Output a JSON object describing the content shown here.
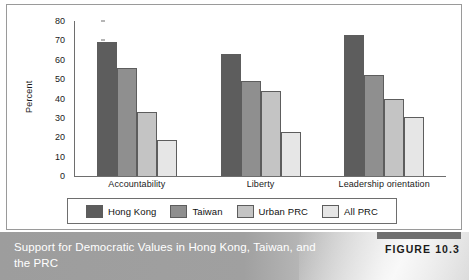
{
  "figure": {
    "caption": "Support for Democratic Values in Hong Kong, Taiwan, and the PRC",
    "figure_number": "FIGURE 10.3"
  },
  "chart_data": {
    "type": "bar",
    "title": "Support for Democratic Values in Hong Kong, Taiwan, and the PRC",
    "categories": [
      "Accountability",
      "Liberty",
      "Leadership orientation"
    ],
    "series": [
      {
        "name": "Hong Kong",
        "color": "#5d5d5d",
        "values": [
          69,
          63,
          73
        ]
      },
      {
        "name": "Taiwan",
        "color": "#8f8f8f",
        "values": [
          56,
          49,
          52
        ]
      },
      {
        "name": "Urban PRC",
        "color": "#c4c4c4",
        "values": [
          33,
          44,
          40
        ]
      },
      {
        "name": "All PRC",
        "color": "#e6e6e6",
        "values": [
          18.5,
          22.5,
          30.5
        ]
      }
    ],
    "xlabel": "",
    "ylabel": "Percent",
    "ylim": [
      0,
      80
    ],
    "yticks": [
      0,
      10,
      20,
      30,
      40,
      50,
      60,
      70,
      80
    ],
    "ytick_labels": [
      "0",
      "10",
      "20",
      "30",
      "40",
      "50",
      "60",
      "70",
      "80"
    ],
    "grid": false,
    "legend_position": "bottom"
  }
}
